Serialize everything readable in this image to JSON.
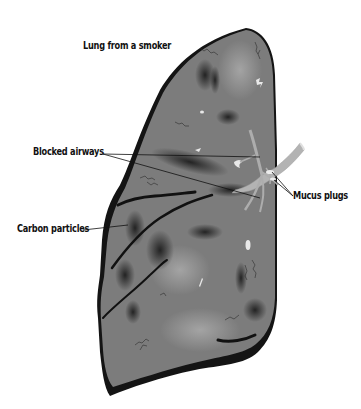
{
  "figure": {
    "title": "Lung from a smoker",
    "labels": {
      "blocked_airways": "Blocked airways",
      "mucus_plugs": "Mucus plugs",
      "carbon_particles": "Carbon particles"
    },
    "colors": {
      "lung_fill": "#7a7a7a",
      "lung_shadow": "#1a1a1a",
      "carbon_spots": "#2a2a2a",
      "bronchus": "#b5b5b5",
      "mucus": "#e6e6e6",
      "leader_line": "#111111",
      "background": "#ffffff"
    }
  }
}
